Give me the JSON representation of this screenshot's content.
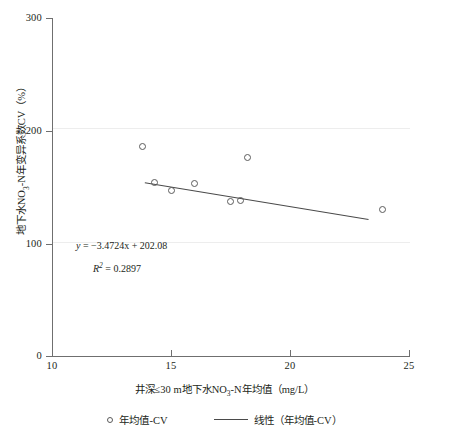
{
  "chart_data": {
    "type": "scatter",
    "title": "",
    "xlabel": "井深≤30 m地下水NO₃⁻-N年均值（mg/L）",
    "ylabel": "地下水NO₃⁻-N年变异系数CV（%）",
    "xlim": [
      10,
      25
    ],
    "ylim": [
      0,
      300
    ],
    "xticks": [
      10,
      15,
      20,
      25
    ],
    "yticks": [
      0,
      100,
      200,
      300
    ],
    "grid": "horizontal-faint",
    "legend_position": "bottom",
    "series": [
      {
        "name": "年均值-CV",
        "marker": "open-circle",
        "points": [
          {
            "x": 13.8,
            "y": 186
          },
          {
            "x": 14.3,
            "y": 154
          },
          {
            "x": 15.0,
            "y": 147
          },
          {
            "x": 16.0,
            "y": 153
          },
          {
            "x": 17.5,
            "y": 137
          },
          {
            "x": 17.9,
            "y": 138
          },
          {
            "x": 18.2,
            "y": 176
          },
          {
            "x": 23.9,
            "y": 130
          }
        ]
      },
      {
        "name": "线性（年均值-CV）",
        "type": "line",
        "equation": "y = -3.4724x + 202.08",
        "slope": -3.4724,
        "intercept": 202.08,
        "r_squared": 0.2897,
        "x_start": 13.9,
        "x_end": 23.3
      }
    ],
    "annotations": {
      "equation_y": "y",
      "equation_rest": " = −3.4724x + 202.08",
      "r2_symbol": "R",
      "r2_exponent": "2",
      "r2_value": " = 0.2897"
    }
  },
  "axes": {
    "y_title": "地下水NO3-N年变异系数CV（%）",
    "y_title_parts": {
      "prefix": "地下水NO",
      "sub": "3",
      "middle": "-N年变异系数CV（%）"
    },
    "x_title_parts": {
      "prefix": "井深≤30 m地下水NO",
      "sub": "3",
      "middle": "-N年均值（mg/L）"
    },
    "y_tick_labels": [
      "300",
      "200",
      "100",
      "0"
    ],
    "x_tick_labels": [
      "10",
      "15",
      "20",
      "25"
    ]
  },
  "legend": {
    "items": [
      {
        "label": "年均值-CV",
        "marker": "open-circle"
      },
      {
        "label": "线性（年均值-CV）",
        "marker": "line"
      }
    ]
  },
  "colors": {
    "axis": "#6f6f6f",
    "grid": "#ededed",
    "marker": "#5b5b5b",
    "trendline": "#4a4a4a",
    "text": "#231f20",
    "background": "#ffffff"
  }
}
